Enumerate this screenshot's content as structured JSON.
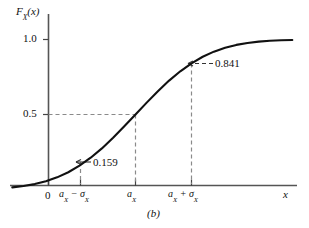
{
  "figure": {
    "caption": "(b)",
    "axis": {
      "ylabel": "F",
      "ylabel_sub": "X",
      "ylabel_arg": "(x)",
      "xlabel": "x"
    },
    "yticks": [
      {
        "label": "1.0",
        "value": 1.0
      },
      {
        "label": "0.5",
        "value": 0.5
      }
    ],
    "xticks": [
      {
        "label": "0",
        "sub": "",
        "tail": ""
      },
      {
        "label": "a",
        "sub": "X",
        "tail": " − σ",
        "tail_sub": "X"
      },
      {
        "label": "a",
        "sub": "X",
        "tail": "",
        "tail_sub": ""
      },
      {
        "label": "a",
        "sub": "X",
        "tail": " + σ",
        "tail_sub": "X"
      }
    ],
    "annotations": [
      {
        "label": "0.159",
        "value": 0.159
      },
      {
        "label": "0.841",
        "value": 0.841
      }
    ]
  },
  "chart_data": {
    "type": "line",
    "title": "",
    "subtitle": "(b)",
    "xlabel": "x",
    "ylabel": "F_X(x)",
    "ylim": [
      0,
      1.05
    ],
    "xlim": [
      -2.6,
      4.0
    ],
    "grid": false,
    "legend": null,
    "x_tick_labels": [
      "0",
      "a_X − σ_X",
      "a_X",
      "a_X + σ_X"
    ],
    "x_tick_values": [
      -2.0,
      -1.0,
      0.0,
      1.0
    ],
    "y_tick_labels": [
      "0.5",
      "1.0"
    ],
    "y_tick_values": [
      0.5,
      1.0
    ],
    "annotated_points": [
      {
        "x_label": "a_X − σ_X",
        "x": -1.0,
        "y": 0.159,
        "label": "0.159"
      },
      {
        "x_label": "a_X",
        "x": 0.0,
        "y": 0.5,
        "label": "0.5"
      },
      {
        "x_label": "a_X + σ_X",
        "x": 1.0,
        "y": 0.841,
        "label": "0.841"
      }
    ],
    "series": [
      {
        "name": "F_X(x)",
        "x": [
          -2.6,
          -2.4,
          -2.2,
          -2.0,
          -1.8,
          -1.6,
          -1.4,
          -1.2,
          -1.0,
          -0.8,
          -0.6,
          -0.4,
          -0.2,
          0.0,
          0.2,
          0.4,
          0.6,
          0.8,
          1.0,
          1.2,
          1.4,
          1.6,
          1.8,
          2.0,
          2.2,
          2.4,
          2.6,
          2.8,
          3.0,
          3.2,
          3.4,
          3.6,
          3.8,
          4.0
        ],
        "values": [
          0.005,
          0.008,
          0.014,
          0.023,
          0.036,
          0.055,
          0.081,
          0.115,
          0.159,
          0.212,
          0.274,
          0.345,
          0.421,
          0.5,
          0.579,
          0.655,
          0.726,
          0.788,
          0.841,
          0.885,
          0.919,
          0.945,
          0.964,
          0.977,
          0.986,
          0.992,
          0.995,
          0.997,
          0.9987,
          0.9993,
          0.9997,
          0.9998,
          0.9999,
          1.0
        ]
      }
    ]
  },
  "colors": {
    "curve": "#111111",
    "axis": "#444444",
    "dashed": "#888888",
    "background": "#ffffff"
  }
}
